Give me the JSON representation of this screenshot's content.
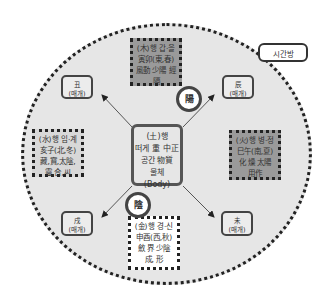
{
  "legend": {
    "label": "시간방"
  },
  "center": {
    "lines": [
      "(土)행",
      "떠게 重 中正",
      "공간 物質",
      "물체",
      "(Body)"
    ]
  },
  "badges": {
    "yang": "陽",
    "yin": "陰"
  },
  "elements": {
    "wood": {
      "lines": [
        "(木)행 갑·을",
        "寅卯(東,春)",
        "風動 少陽 經",
        "隔"
      ],
      "shade": "dark"
    },
    "fire": {
      "lines": [
        "(火)행 병·정",
        "巳午(南,夏)",
        "化 燥 太陽",
        "用作"
      ],
      "shade": "dark"
    },
    "water": {
      "lines": [
        "(水)행 임·계",
        "亥子(北,冬)",
        "藏,寶,太陰,",
        "靈,合,씨"
      ],
      "shade": "light"
    },
    "metal": {
      "lines": [
        "(金)행 경·신",
        "申酉(西,秋)",
        "斂 界 少陰",
        "成, 形"
      ],
      "shade": "white"
    }
  },
  "branches": {
    "chou": {
      "char": "丑",
      "sub": "(매개)"
    },
    "chen": {
      "char": "辰",
      "sub": "(매개)"
    },
    "xu": {
      "char": "戌",
      "sub": "(매개)"
    },
    "wei": {
      "char": "未",
      "sub": "(매개)"
    }
  },
  "colors": {
    "circle_fill": "#e6e6e6",
    "dark_box": "#9a9a9a",
    "light_box": "#d8d8d8",
    "border": "#222222"
  }
}
